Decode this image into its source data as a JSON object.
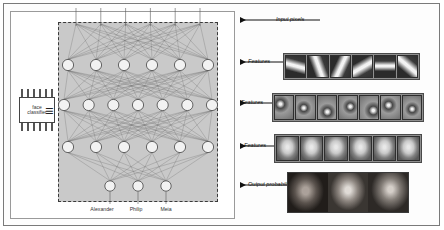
{
  "figure": {
    "classifier_box": {
      "line1": "face",
      "line2": "classifier",
      "equals_symbol": "≡"
    },
    "network": {
      "layers": [
        {
          "name": "input",
          "count": 6,
          "role": "input pixels"
        },
        {
          "name": "hidden1",
          "count": 6,
          "role": "features"
        },
        {
          "name": "hidden2",
          "count": 7,
          "role": "features"
        },
        {
          "name": "hidden3",
          "count": 6,
          "role": "features"
        },
        {
          "name": "output",
          "count": 3,
          "role": "output probabilities"
        }
      ]
    },
    "output_labels": [
      "Alexander",
      "Philip",
      "Meia"
    ],
    "callouts": [
      {
        "text": "Input pixels"
      },
      {
        "text": "Features"
      },
      {
        "text": "Features"
      },
      {
        "text": "Features"
      },
      {
        "text": "Output probabilities"
      }
    ],
    "feature_strips": [
      {
        "id": "edges",
        "tile_count": 6,
        "description": "oriented edge / Gabor-like filters"
      },
      {
        "id": "parts",
        "tile_count": 7,
        "description": "eye, nose and curve part detectors"
      },
      {
        "id": "faces",
        "tile_count": 6,
        "description": "whole-face templates"
      }
    ],
    "photo_strip": {
      "id": "output-faces",
      "photo_count": 3,
      "description": "photographs of three faces"
    },
    "colors": {
      "network_background": "#c9c9c9",
      "node_fill": "#f2f2f2",
      "edge": "#6b6b6b",
      "frame": "#7a7a7a",
      "strip_border": "#4a4a4a"
    }
  }
}
